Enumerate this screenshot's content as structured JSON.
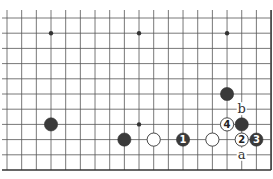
{
  "diagram": {
    "type": "go-board-fragment",
    "columns": 19,
    "rows": 11,
    "right_edge": true,
    "bottom_edge": true,
    "grid": {
      "x0": 7,
      "dx": 14.67,
      "y0": 18,
      "dy": 15.2
    },
    "colors": {
      "line": "#555555",
      "black_stone": "#3a3a3a",
      "white_stone": "#ffffff",
      "edge": "#333333"
    },
    "star_points": [
      {
        "col": 3,
        "row": 1
      },
      {
        "col": 9,
        "row": 1
      },
      {
        "col": 15,
        "row": 1
      },
      {
        "col": 3,
        "row": 7
      },
      {
        "col": 9,
        "row": 7
      },
      {
        "col": 15,
        "row": 7
      }
    ],
    "stones": [
      {
        "color": "black",
        "col": 3,
        "row": 7,
        "label": ""
      },
      {
        "color": "black",
        "col": 8,
        "row": 8,
        "label": ""
      },
      {
        "color": "white",
        "col": 10,
        "row": 8,
        "label": ""
      },
      {
        "color": "black",
        "col": 12,
        "row": 8,
        "label": "1"
      },
      {
        "color": "white",
        "col": 14,
        "row": 8,
        "label": ""
      },
      {
        "color": "black",
        "col": 15,
        "row": 5,
        "label": ""
      },
      {
        "color": "white",
        "col": 15,
        "row": 7,
        "label": "4"
      },
      {
        "color": "black",
        "col": 16,
        "row": 7,
        "label": ""
      },
      {
        "color": "white",
        "col": 16,
        "row": 8,
        "label": "2"
      },
      {
        "color": "black",
        "col": 17,
        "row": 8,
        "label": "3"
      }
    ],
    "point_labels": [
      {
        "text": "b",
        "col": 16,
        "row": 6
      },
      {
        "text": "a",
        "col": 16,
        "row": 9
      }
    ]
  }
}
